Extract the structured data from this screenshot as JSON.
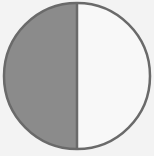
{
  "figure": {
    "type": "fraction-circle",
    "parts_total": 2,
    "parts_shaded": 1,
    "shaded_side": "left",
    "colors": {
      "background": "#f3f3f3",
      "shaded": "#8b8b8b",
      "unshaded": "#f8f8f8",
      "outline": "#6a6a6a"
    },
    "geometry": {
      "cx": 77,
      "cy": 76,
      "r": 73,
      "stroke_width": 2.5
    }
  }
}
